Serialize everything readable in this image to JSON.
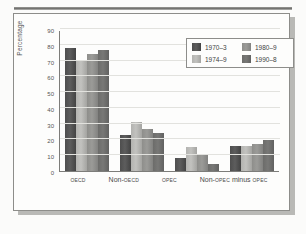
{
  "chart_data": {
    "type": "bar",
    "title": "",
    "xlabel": "",
    "ylabel": "Percentage",
    "ylim": [
      0,
      90
    ],
    "ytick_step": 10,
    "yticks": [
      90,
      80,
      70,
      60,
      50,
      40,
      30,
      20,
      10,
      0
    ],
    "grid": true,
    "legend_position": "top-right",
    "categories": [
      "OECD",
      "Non-OECD",
      "OPEC",
      "Non-OPEC minus OPEC"
    ],
    "series": [
      {
        "name": "1970–3",
        "color": "#4e4e4e",
        "values": [
          78,
          23,
          8,
          16
        ]
      },
      {
        "name": "1974–9",
        "color": "#b3b3b0",
        "values": [
          70.5,
          31,
          15,
          16
        ]
      },
      {
        "name": "1980–9",
        "color": "#8e8e8b",
        "values": [
          74,
          26.5,
          10,
          17
        ]
      },
      {
        "name": "1990–8",
        "color": "#6c6c6a",
        "values": [
          77,
          24,
          4.5,
          19.5
        ]
      }
    ]
  },
  "xlabels": [
    {
      "pre": "",
      "sc": "OECD",
      "post": "",
      "sc2": ""
    },
    {
      "pre": "Non-",
      "sc": "OECD",
      "post": "",
      "sc2": ""
    },
    {
      "pre": "",
      "sc": "OPEC",
      "post": "",
      "sc2": ""
    },
    {
      "pre": "Non-",
      "sc": "OPEC",
      "post": " minus ",
      "sc2": "OPEC"
    }
  ],
  "figure": {
    "y_axis_label": "Percentage"
  }
}
